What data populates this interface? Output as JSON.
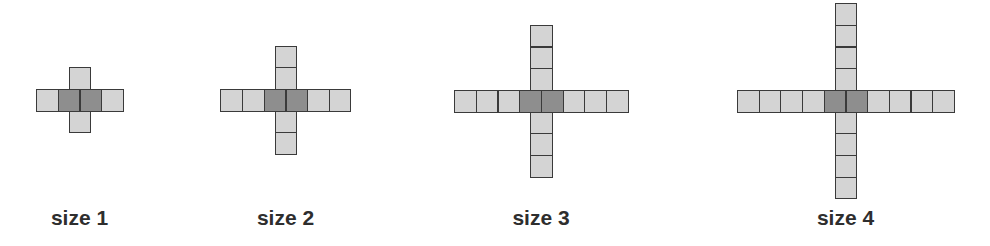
{
  "diagram": {
    "colors": {
      "light_cell": "#d4d4d4",
      "dark_cell": "#8e8e8e",
      "border": "#3a3a3a",
      "label": "#2e2e2e",
      "background": "#ffffff"
    },
    "cell_size": 21.7,
    "crosses": [
      {
        "label": "size 1",
        "size": 1,
        "center_x": 79.5,
        "row_top": 89,
        "horizontal_cells": 4,
        "arm_up": 1,
        "arm_down": 1,
        "dark_center_cells": 2
      },
      {
        "label": "size 2",
        "size": 2,
        "center_x": 285.5,
        "row_top": 89,
        "horizontal_cells": 6,
        "arm_up": 2,
        "arm_down": 2,
        "dark_center_cells": 2
      },
      {
        "label": "size 3",
        "size": 3,
        "center_x": 541,
        "row_top": 90,
        "horizontal_cells": 8,
        "arm_up": 3,
        "arm_down": 3,
        "dark_center_cells": 2
      },
      {
        "label": "size 4",
        "size": 4,
        "center_x": 845.5,
        "row_top": 90,
        "horizontal_cells": 10,
        "arm_up": 4,
        "arm_down": 4,
        "dark_center_cells": 2
      }
    ]
  }
}
